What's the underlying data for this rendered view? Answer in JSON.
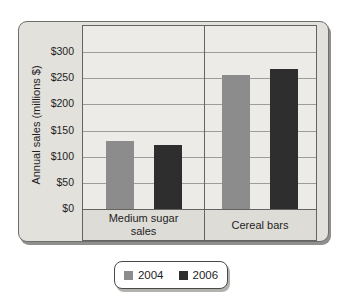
{
  "chart_data": {
    "type": "bar",
    "title": "",
    "categories": [
      "Medium sugar sales",
      "Cereal bars"
    ],
    "series": [
      {
        "name": "2004",
        "color": "#8c8c8c",
        "values": [
          130,
          256
        ]
      },
      {
        "name": "2006",
        "color": "#2e2e2e",
        "values": [
          123,
          268
        ]
      }
    ],
    "xlabel": "",
    "ylabel": "Annual sales (millions $)",
    "yticks": [
      0,
      50,
      100,
      150,
      200,
      250,
      300
    ],
    "ytick_labels": [
      "$0",
      "$50",
      "$100",
      "$150",
      "$200",
      "$250",
      "$300"
    ],
    "ylim": [
      0,
      350
    ],
    "grid": true,
    "legend_position": "bottom",
    "panel_split_ratio": 0.52
  },
  "styles": {
    "frame_bg": "#e3e1dc",
    "plot_bg": "#edebe7",
    "band_bg": "#dedcd7",
    "grid_color": "#9c9c98",
    "border_color": "#636361",
    "text_color": "#1e1e1e"
  }
}
